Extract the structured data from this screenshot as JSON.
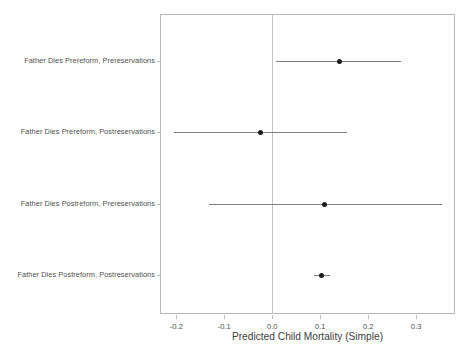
{
  "chart_data": {
    "type": "scatter",
    "title": "",
    "subtitle": "",
    "xlabel": "Predicted Child Mortality (Simple)",
    "ylabel": "",
    "orientation": "horizontal",
    "grid": false,
    "legend": null,
    "xlim": [
      -0.232,
      0.379
    ],
    "xticks": [
      -0.2,
      -0.1,
      0.0,
      0.1,
      0.2,
      0.3
    ],
    "xticklabels": [
      "-0.2",
      "-0.1",
      "0.0",
      "0.1",
      "0.2",
      "0.3"
    ],
    "reference_line": {
      "orientation": "vertical",
      "value": 0.0,
      "color": "#c4c4c4"
    },
    "categories": [
      "Father Dies Prereform, Prereservations",
      "Father Dies Prereform, Postreservations",
      "Father Dies Postreform, Prereservations",
      "Father Dies Postreform, Postreservations"
    ],
    "values": [
      0.14,
      -0.025,
      0.108,
      0.102
    ],
    "ci_low": [
      0.008,
      -0.204,
      -0.131,
      0.087
    ],
    "ci_high": [
      0.269,
      0.156,
      0.354,
      0.121
    ],
    "points": [
      {
        "label": "Father Dies Prereform, Prereservations",
        "estimate": 0.14,
        "ci_low": 0.008,
        "ci_high": 0.269
      },
      {
        "label": "Father Dies Prereform, Postreservations",
        "estimate": -0.025,
        "ci_low": -0.204,
        "ci_high": 0.156
      },
      {
        "label": "Father Dies Postreform, Prereservations",
        "estimate": 0.108,
        "ci_low": -0.131,
        "ci_high": 0.354
      },
      {
        "label": "Father Dies Postreform, Postreservations",
        "estimate": 0.102,
        "ci_low": 0.087,
        "ci_high": 0.121
      }
    ],
    "colors": {
      "point": "#1a1a1a",
      "interval": "#7d7d7d",
      "axis": "#b9b9b9",
      "reference": "#c4c4c4",
      "text": "#4f4f4f",
      "background": "#ffffff"
    }
  }
}
